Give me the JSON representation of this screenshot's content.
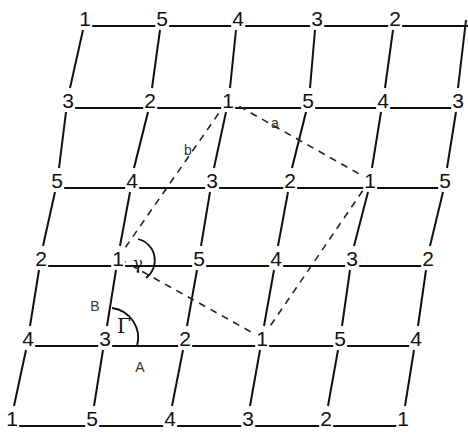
{
  "diagram": {
    "type": "oblique-lattice",
    "rows": [
      {
        "y": 18,
        "nodes": [
          {
            "x": 85,
            "label": "1"
          },
          {
            "x": 162,
            "label": "5"
          },
          {
            "x": 238,
            "label": "4"
          },
          {
            "x": 317,
            "label": "3"
          },
          {
            "x": 395,
            "label": "2"
          }
        ]
      },
      {
        "y": 100,
        "nodes": [
          {
            "x": 68,
            "label": "3"
          },
          {
            "x": 150,
            "label": "2"
          },
          {
            "x": 228,
            "label": "1"
          },
          {
            "x": 308,
            "label": "5"
          },
          {
            "x": 383,
            "label": "4"
          },
          {
            "x": 458,
            "label": "3"
          }
        ]
      },
      {
        "y": 180,
        "nodes": [
          {
            "x": 57,
            "label": "5"
          },
          {
            "x": 132,
            "label": "4"
          },
          {
            "x": 212,
            "label": "3"
          },
          {
            "x": 290,
            "label": "2"
          },
          {
            "x": 370,
            "label": "1"
          },
          {
            "x": 445,
            "label": "5"
          }
        ]
      },
      {
        "y": 258,
        "nodes": [
          {
            "x": 41,
            "label": "2"
          },
          {
            "x": 118,
            "label": "1"
          },
          {
            "x": 199,
            "label": "5"
          },
          {
            "x": 276,
            "label": "4"
          },
          {
            "x": 352,
            "label": "3"
          },
          {
            "x": 428,
            "label": "2"
          }
        ]
      },
      {
        "y": 338,
        "nodes": [
          {
            "x": 28,
            "label": "4"
          },
          {
            "x": 105,
            "label": "3"
          },
          {
            "x": 185,
            "label": "2"
          },
          {
            "x": 262,
            "label": "1"
          },
          {
            "x": 340,
            "label": "5"
          },
          {
            "x": 416,
            "label": "4"
          }
        ]
      },
      {
        "y": 418,
        "nodes": [
          {
            "x": 12,
            "label": "1"
          },
          {
            "x": 92,
            "label": "5"
          },
          {
            "x": 170,
            "label": "4"
          },
          {
            "x": 248,
            "label": "3"
          },
          {
            "x": 326,
            "label": "2"
          },
          {
            "x": 403,
            "label": "1"
          }
        ]
      }
    ],
    "dashed_cell": [
      [
        228,
        100
      ],
      [
        370,
        180
      ],
      [
        262,
        338
      ],
      [
        118,
        258
      ]
    ],
    "labels": {
      "a": "a",
      "b": "b",
      "gamma": "γ",
      "Gamma": "Γ",
      "A": "A",
      "B": "B"
    },
    "colors": {
      "line": "#111111",
      "dashed": "#222222",
      "background": "#ffffff"
    }
  }
}
